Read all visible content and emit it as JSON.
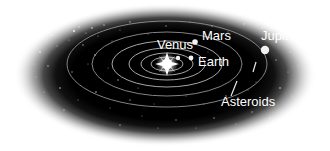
{
  "diagram": {
    "background_color": "#ffffff",
    "field_color": "#000000",
    "orbit_color": "#b9b9b9",
    "label_color": "#ffffff",
    "labels": [
      {
        "id": "venus",
        "text": "Venus",
        "x": 175,
        "y": 49,
        "anchor": "middle"
      },
      {
        "id": "mars",
        "text": "Mars",
        "x": 202,
        "y": 40,
        "anchor": "start"
      },
      {
        "id": "earth",
        "text": "Earth",
        "x": 198,
        "y": 66,
        "anchor": "start"
      },
      {
        "id": "jupiter",
        "text": "Jupiter",
        "x": 261,
        "y": 40,
        "anchor": "start"
      },
      {
        "id": "asteroids",
        "text": "Asteroids",
        "x": 221,
        "y": 106,
        "anchor": "start"
      }
    ],
    "bodies": [
      {
        "id": "sun",
        "name": "Sun",
        "x": 167,
        "y": 64,
        "r": 5.2,
        "kind": "star"
      },
      {
        "id": "venus",
        "name": "Venus",
        "x": 178,
        "y": 58,
        "r": 2.2,
        "kind": "planet"
      },
      {
        "id": "earth",
        "name": "Earth",
        "x": 191,
        "y": 58,
        "r": 2.4,
        "kind": "planet"
      },
      {
        "id": "mars",
        "name": "Mars",
        "x": 195,
        "y": 42,
        "r": 2.8,
        "kind": "planet"
      },
      {
        "id": "jupiter",
        "name": "Jupiter",
        "x": 265,
        "y": 50,
        "r": 4.2,
        "kind": "planet"
      }
    ],
    "orbit_count": 6,
    "orbits": [
      {
        "id": "orbit-1",
        "rx": 16,
        "ry": 7
      },
      {
        "id": "orbit-2",
        "rx": 26,
        "ry": 11
      },
      {
        "id": "orbit-3",
        "rx": 38,
        "ry": 16
      },
      {
        "id": "orbit-4",
        "rx": 55,
        "ry": 23
      },
      {
        "id": "orbit-5",
        "rx": 75,
        "ry": 32
      },
      {
        "id": "orbit-6",
        "rx": 100,
        "ry": 43
      }
    ],
    "orbit_center": {
      "x": 167,
      "y": 64
    },
    "annotations": [
      {
        "id": "asteroid-leader",
        "from": {
          "x": 237,
          "y": 81
        },
        "to": {
          "x": 231,
          "y": 96
        }
      },
      {
        "id": "jupiter-tick",
        "from": {
          "x": 256,
          "y": 62
        },
        "to": {
          "x": 253,
          "y": 72
        }
      }
    ],
    "field": {
      "cx": 165,
      "cy": 75,
      "rx": 152,
      "ry": 72,
      "edge_softness": "gradient"
    }
  }
}
